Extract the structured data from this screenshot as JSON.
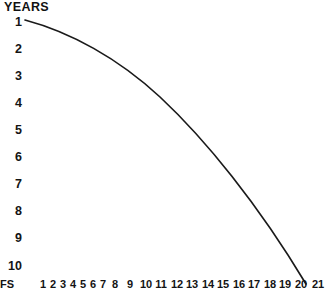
{
  "chart_data": {
    "type": "line",
    "title": "YEARS",
    "xlabel": "",
    "ylabel": "",
    "grid": false,
    "legend": null,
    "y_axis": {
      "inverted": true,
      "tick_labels": [
        "1",
        "2",
        "3",
        "4",
        "5",
        "6",
        "7",
        "8",
        "9",
        "10"
      ],
      "ylim": [
        1,
        10
      ]
    },
    "x_axis": {
      "prefix_label": "FS",
      "tick_labels": [
        "1",
        "2",
        "3",
        "4",
        "5",
        "6",
        "7",
        "8",
        "9",
        "10",
        "11",
        "12",
        "13",
        "14",
        "15",
        "16",
        "17",
        "18",
        "19",
        "20",
        "21"
      ],
      "xlim": [
        1,
        21
      ],
      "clipped_at_bottom": true
    },
    "series": [
      {
        "name": "decay-curve",
        "color": "#1a1a1a",
        "x": [
          1,
          2,
          3,
          4,
          5,
          6,
          7,
          8,
          9,
          10,
          11,
          12,
          13,
          14,
          15,
          16,
          17,
          18,
          19,
          20,
          21
        ],
        "y": [
          1.0,
          1.2,
          1.45,
          1.7,
          2.0,
          2.35,
          2.7,
          3.1,
          3.55,
          4.0,
          4.5,
          5.05,
          5.6,
          6.2,
          6.85,
          7.5,
          8.2,
          8.9,
          9.6,
          10.3,
          11.0
        ]
      }
    ]
  },
  "layout": {
    "curve_path": "M 25 20 C 70 32 118 58 160 97 C 205 139 258 204 306 284",
    "y_label_positions": [
      22,
      49,
      76,
      103,
      130,
      157,
      184,
      211,
      238,
      266
    ],
    "x_label_positions": [
      43,
      53,
      63,
      73,
      83,
      93,
      103,
      115,
      130,
      146,
      161,
      177,
      192,
      208,
      223,
      239,
      254,
      270,
      285,
      301,
      318
    ],
    "y_label_left": 2,
    "curve_color": "#1a1a1a",
    "curve_width": 1.7
  }
}
